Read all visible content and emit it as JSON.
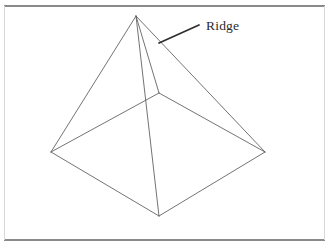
{
  "figure": {
    "canvas": {
      "width": 328,
      "height": 249
    },
    "background_color": "#ffffff"
  },
  "annotations": [
    {
      "id": "ridge-label",
      "text": "Ridge",
      "text_x": 206,
      "text_y": 30,
      "color": "#2b2b2b",
      "leader": {
        "x1": 159,
        "y1": 43,
        "x2": 199,
        "y2": 25,
        "color": "#2e2e2e"
      }
    }
  ],
  "rules": {
    "color": "#8a8a8a",
    "top": {
      "x1": 4,
      "y1": 6,
      "x2": 325,
      "y2": 6
    },
    "bottom": {
      "x1": 4,
      "y1": 240,
      "x2": 325,
      "y2": 240
    }
  },
  "frame": {
    "color": "#d8d8d8",
    "left": {
      "x1": 4,
      "y1": 6,
      "x2": 4,
      "y2": 240
    },
    "right": {
      "x1": 325,
      "y1": 6,
      "x2": 325,
      "y2": 240
    }
  },
  "geometry": {
    "stroke_color": "#5a5a5a",
    "vertices": {
      "apex": {
        "x": 136,
        "y": 16
      },
      "base_left": {
        "x": 51,
        "y": 152
      },
      "base_back": {
        "x": 159,
        "y": 93
      },
      "base_right": {
        "x": 265,
        "y": 152
      },
      "base_front": {
        "x": 159,
        "y": 216
      },
      "ridge_break": {
        "x": 175,
        "y": 86
      }
    },
    "edges": [
      {
        "name": "apex-to-base-left",
        "from": "apex",
        "to": "base_left"
      },
      {
        "name": "apex-to-base-right",
        "from": "apex",
        "to": "base_right"
      },
      {
        "name": "apex-to-base-back",
        "from": "apex",
        "to": "base_back"
      },
      {
        "name": "ridge-edge",
        "from": "apex",
        "to": "base_front"
      },
      {
        "name": "base-left-to-back",
        "from": "base_left",
        "to": "base_back"
      },
      {
        "name": "base-back-to-right",
        "from": "base_back",
        "to": "base_right"
      },
      {
        "name": "base-left-to-front",
        "from": "base_left",
        "to": "base_front"
      },
      {
        "name": "base-front-to-right",
        "from": "base_front",
        "to": "base_right"
      }
    ]
  },
  "ground_plane": {
    "dot_color": "#b9a9a9",
    "dot_spacing": 7,
    "dot_radius": 0.65,
    "description": "stippled dotted ground plane under and around the pyramid base"
  }
}
